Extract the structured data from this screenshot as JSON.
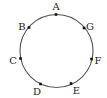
{
  "diagram": {
    "type": "circle-with-points",
    "circle": {
      "cx": 56.5,
      "cy": 51,
      "r": 36.5,
      "stroke": "#555555",
      "stroke_width": 1.1
    },
    "points": [
      {
        "label": "A",
        "x": 56,
        "y": 14.5,
        "lx": 56,
        "ly": 9.5,
        "anchor": "middle"
      },
      {
        "label": "B",
        "x": 29,
        "y": 27.5,
        "lx": 22,
        "ly": 29.5,
        "anchor": "middle"
      },
      {
        "label": "C",
        "x": 20.5,
        "y": 58.5,
        "lx": 13,
        "ly": 63.5,
        "anchor": "middle"
      },
      {
        "label": "D",
        "x": 40.5,
        "y": 84,
        "lx": 37,
        "ly": 95,
        "anchor": "middle"
      },
      {
        "label": "E",
        "x": 71,
        "y": 83.5,
        "lx": 76.5,
        "ly": 94,
        "anchor": "middle"
      },
      {
        "label": "F",
        "x": 91.5,
        "y": 59,
        "lx": 98,
        "ly": 63.5,
        "anchor": "middle"
      },
      {
        "label": "G",
        "x": 84,
        "y": 28,
        "lx": 90,
        "ly": 29.5,
        "anchor": "middle"
      }
    ],
    "point_color": "#111111",
    "point_size": 2.6
  }
}
